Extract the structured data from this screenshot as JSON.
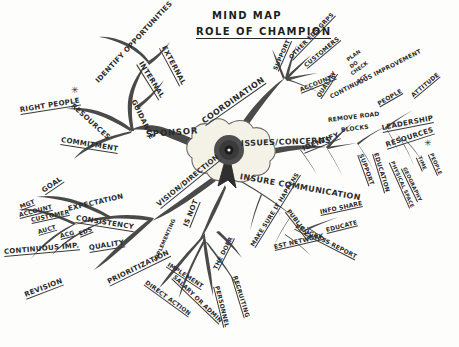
{
  "diagram": {
    "kind": "hand-drawn-mind-map",
    "title_line1": "MIND MAP",
    "title_line2": "ROLE OF CHAMPION",
    "center_node": {
      "icon": "award-rosette-icon",
      "label": ""
    },
    "main_branches": [
      "IDENTIFY OPPORTUNITIES",
      "SPONSOR",
      "COORDINATION",
      "ISSUES/CONCERNS",
      "INSURE COMMUNICATION",
      "VISION/DIRECTION",
      "IS NOT"
    ],
    "labels": [
      {
        "text": "MIND MAP",
        "x": 212,
        "y": 10,
        "rot": 0,
        "size": "title",
        "underline": false
      },
      {
        "text": "ROLE OF CHAMPION",
        "x": 196,
        "y": 26,
        "rot": 0,
        "size": "title",
        "underline": true
      },
      {
        "text": "IDENTIFY OPPORTUNITIES",
        "x": 97,
        "y": 78,
        "rot": -47,
        "size": "mid",
        "underline": false
      },
      {
        "text": "EXTERNAL",
        "x": 163,
        "y": 42,
        "rot": 62,
        "size": "mid",
        "underline": true
      },
      {
        "text": "INTERNAL",
        "x": 140,
        "y": 58,
        "rot": 58,
        "size": "mid",
        "underline": true
      },
      {
        "text": "GUIDANCE",
        "x": 133,
        "y": 96,
        "rot": 64,
        "size": "mid",
        "underline": false
      },
      {
        "text": "RESOURCES",
        "x": 72,
        "y": 101,
        "rot": 42,
        "size": "mid",
        "underline": false
      },
      {
        "text": "RIGHT PEOPLE",
        "x": 20,
        "y": 106,
        "rot": -9,
        "size": "mid",
        "underline": true
      },
      {
        "text": "COMMITMENT",
        "x": 61,
        "y": 136,
        "rot": 9,
        "size": "mid",
        "underline": true
      },
      {
        "text": "SPONSOR",
        "x": 146,
        "y": 129,
        "rot": -4,
        "size": "sponsor",
        "underline": false
      },
      {
        "text": "GOAL",
        "x": 43,
        "y": 187,
        "rot": -34,
        "size": "mid",
        "underline": true
      },
      {
        "text": "EXPECTATION",
        "x": 68,
        "y": 205,
        "rot": -13,
        "size": "mid",
        "underline": false
      },
      {
        "text": "MGT",
        "x": 20,
        "y": 203,
        "rot": -21,
        "size": "sml",
        "underline": true
      },
      {
        "text": "ACCOUNT",
        "x": 19,
        "y": 211,
        "rot": -14,
        "size": "sml",
        "underline": true
      },
      {
        "text": "CUSTOMER",
        "x": 31,
        "y": 216,
        "rot": -12,
        "size": "sml",
        "underline": true
      },
      {
        "text": "AUCT",
        "x": 38,
        "y": 228,
        "rot": -16,
        "size": "sml",
        "underline": true
      },
      {
        "text": "ACG",
        "x": 60,
        "y": 232,
        "rot": -14,
        "size": "sml",
        "underline": true
      },
      {
        "text": "EDS",
        "x": 79,
        "y": 230,
        "rot": -22,
        "size": "sml",
        "underline": true
      },
      {
        "text": "CONSISTENCY",
        "x": 76,
        "y": 214,
        "rot": 9,
        "size": "mid",
        "underline": true
      },
      {
        "text": "CONTINUOUS IMP.",
        "x": 4,
        "y": 248,
        "rot": -5,
        "size": "mid",
        "underline": true
      },
      {
        "text": "QUALITY",
        "x": 89,
        "y": 244,
        "rot": -9,
        "size": "mid",
        "underline": true
      },
      {
        "text": "REVISION",
        "x": 25,
        "y": 291,
        "rot": -21,
        "size": "mid",
        "underline": true
      },
      {
        "text": "PRIORITIZATION",
        "x": 108,
        "y": 278,
        "rot": -26,
        "size": "mid",
        "underline": true
      },
      {
        "text": "VISION/DIRECTION",
        "x": 158,
        "y": 201,
        "rot": -39,
        "size": "mid",
        "underline": true
      },
      {
        "text": "COORDINATION",
        "x": 203,
        "y": 117,
        "rot": -35,
        "size": "big",
        "underline": true
      },
      {
        "text": "SUPPORT",
        "x": 275,
        "y": 66,
        "rot": -66,
        "size": "sml",
        "underline": true
      },
      {
        "text": "OTHER EDS GRPS",
        "x": 290,
        "y": 54,
        "rot": -46,
        "size": "sml",
        "underline": true
      },
      {
        "text": "CUSTOMERS",
        "x": 305,
        "y": 62,
        "rot": -40,
        "size": "sml",
        "underline": true
      },
      {
        "text": "ACCOUNTS",
        "x": 300,
        "y": 86,
        "rot": -22,
        "size": "sml",
        "underline": true
      },
      {
        "text": "PLAN",
        "x": 347,
        "y": 57,
        "rot": -36,
        "size": "xsml",
        "underline": false
      },
      {
        "text": "DO",
        "x": 350,
        "y": 64,
        "rot": -36,
        "size": "xsml",
        "underline": false
      },
      {
        "text": "CHECK",
        "x": 351,
        "y": 71,
        "rot": -36,
        "size": "xsml",
        "underline": false
      },
      {
        "text": "ACT",
        "x": 357,
        "y": 79,
        "rot": -36,
        "size": "xsml",
        "underline": false
      },
      {
        "text": "QUALITY",
        "x": 318,
        "y": 93,
        "rot": -56,
        "size": "sml",
        "underline": true
      },
      {
        "text": "CONTINUOUS IMPROVEMENT",
        "x": 330,
        "y": 93,
        "rot": -27,
        "size": "sml",
        "underline": false
      },
      {
        "text": "ISSUES/CONCERNS",
        "x": 241,
        "y": 139,
        "rot": -2,
        "size": "big",
        "underline": false
      },
      {
        "text": "IDENTIFY",
        "x": 303,
        "y": 145,
        "rot": -22,
        "size": "mid",
        "underline": true
      },
      {
        "text": "REMOVE ROAD",
        "x": 328,
        "y": 116,
        "rot": -7,
        "size": "sml",
        "underline": false
      },
      {
        "text": "BLOCKS",
        "x": 341,
        "y": 126,
        "rot": -7,
        "size": "sml",
        "underline": false
      },
      {
        "text": "PEOPLE",
        "x": 378,
        "y": 100,
        "rot": -30,
        "size": "sml",
        "underline": true
      },
      {
        "text": "ATTITUDE",
        "x": 412,
        "y": 92,
        "rot": -40,
        "size": "sml",
        "underline": true
      },
      {
        "text": "LEADERSHIP",
        "x": 382,
        "y": 124,
        "rot": -11,
        "size": "mid",
        "underline": true
      },
      {
        "text": "SUPPORT",
        "x": 361,
        "y": 150,
        "rot": 70,
        "size": "sml",
        "underline": true
      },
      {
        "text": "EDUCATION",
        "x": 376,
        "y": 149,
        "rot": 73,
        "size": "sml",
        "underline": true
      },
      {
        "text": "RESOURCES",
        "x": 386,
        "y": 141,
        "rot": -18,
        "size": "mid",
        "underline": true
      },
      {
        "text": "PHYSICAL SPACE",
        "x": 392,
        "y": 158,
        "rot": 66,
        "size": "xsml",
        "underline": true
      },
      {
        "text": "GEOGRAPHY",
        "x": 404,
        "y": 164,
        "rot": 64,
        "size": "xsml",
        "underline": true
      },
      {
        "text": "TIME",
        "x": 419,
        "y": 153,
        "rot": 66,
        "size": "xsml",
        "underline": true
      },
      {
        "text": "PEOPLE",
        "x": 431,
        "y": 150,
        "rot": 66,
        "size": "xsml",
        "underline": true
      },
      {
        "text": "INSURE COMMUNICATION",
        "x": 240,
        "y": 172,
        "rot": 10,
        "size": "big",
        "underline": false
      },
      {
        "text": "INFO SHARE",
        "x": 320,
        "y": 208,
        "rot": -12,
        "size": "sml",
        "underline": true
      },
      {
        "text": "EDUCATE",
        "x": 326,
        "y": 226,
        "rot": -14,
        "size": "sml",
        "underline": true
      },
      {
        "text": "PUBLICIZE",
        "x": 288,
        "y": 206,
        "rot": 52,
        "size": "sml",
        "underline": true
      },
      {
        "text": "PROGRESS REPORT",
        "x": 296,
        "y": 222,
        "rot": 27,
        "size": "sml",
        "underline": true
      },
      {
        "text": "EST NETWORK",
        "x": 274,
        "y": 243,
        "rot": -13,
        "size": "sml",
        "underline": true
      },
      {
        "text": "MAKE SURE IT HAPPENS",
        "x": 252,
        "y": 242,
        "rot": -58,
        "size": "sml",
        "underline": true
      },
      {
        "text": "IS NOT",
        "x": 186,
        "y": 222,
        "rot": -68,
        "size": "mid",
        "underline": true
      },
      {
        "text": "THE DOER",
        "x": 215,
        "y": 265,
        "rot": -63,
        "size": "sml",
        "underline": true
      },
      {
        "text": "RECRUITING",
        "x": 235,
        "y": 272,
        "rot": 73,
        "size": "sml",
        "underline": true
      },
      {
        "text": "PERSONNEL",
        "x": 217,
        "y": 282,
        "rot": 76,
        "size": "sml",
        "underline": true
      },
      {
        "text": "SALARY OR ADMIN",
        "x": 174,
        "y": 272,
        "rot": 44,
        "size": "sml",
        "underline": true
      },
      {
        "text": "DIRECT ACTION",
        "x": 146,
        "y": 278,
        "rot": 36,
        "size": "sml",
        "underline": true
      },
      {
        "text": "IMPLEMENT",
        "x": 168,
        "y": 260,
        "rot": 33,
        "size": "sml",
        "underline": true
      },
      {
        "text": "IMPLEMENTING",
        "x": 155,
        "y": 258,
        "rot": -66,
        "size": "xsml",
        "underline": false
      }
    ],
    "markers": [
      {
        "name": "asterisk-marker-left",
        "glyph": "✳",
        "x": 71,
        "y": 85
      },
      {
        "name": "asterisk-marker-right",
        "glyph": "✳",
        "x": 424,
        "y": 138
      }
    ]
  }
}
